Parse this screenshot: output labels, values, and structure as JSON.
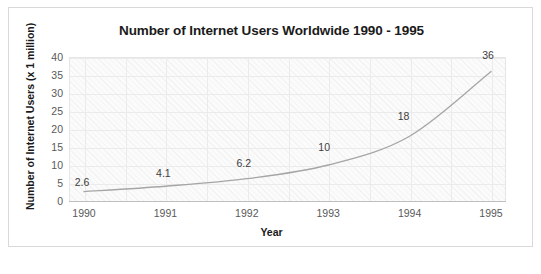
{
  "figure": {
    "caption_faint": ""
  },
  "chart_data": {
    "type": "line",
    "title": "Number of Internet Users Worldwide 1990 - 1995",
    "xlabel": "Year",
    "ylabel": "Number of Internet Users (x 1 million)",
    "categories": [
      "1990",
      "1991",
      "1992",
      "1993",
      "1994",
      "1995"
    ],
    "values": [
      2.6,
      4.1,
      6.2,
      10,
      18,
      36
    ],
    "point_labels": [
      "2.6",
      "4.1",
      "6.2",
      "10",
      "18",
      "36"
    ],
    "series": [
      {
        "name": "Number of Internet Users",
        "values": [
          2.6,
          4.1,
          6.2,
          10,
          18,
          36
        ],
        "color": "#a6a6a6"
      }
    ],
    "ylim": [
      0,
      40
    ],
    "yticks": [
      "40",
      "35",
      "30",
      "25",
      "20",
      "15",
      "10",
      "5",
      "0"
    ],
    "ytick_values": [
      40,
      35,
      30,
      25,
      20,
      15,
      10,
      5,
      0
    ],
    "xticks": [
      "1990",
      "1991",
      "1992",
      "1993",
      "1994",
      "1995"
    ],
    "grid": true,
    "legend": false,
    "legend_position": "none",
    "smooth": true,
    "plot_background": "#fbfbfb",
    "gridline_color": "#ebebeb",
    "axis_color": "#bfbfbf"
  }
}
